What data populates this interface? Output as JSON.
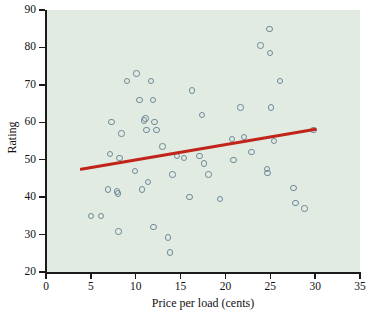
{
  "chart_data": {
    "type": "scatter",
    "title": "",
    "xlabel": "Price per load (cents)",
    "ylabel": "Rating",
    "xlim": [
      0,
      35
    ],
    "ylim": [
      20,
      90
    ],
    "xticks": [
      0,
      5,
      10,
      15,
      20,
      25,
      30,
      35
    ],
    "yticks": [
      20,
      30,
      40,
      50,
      60,
      70,
      80,
      90
    ],
    "grid": false,
    "legend": "none",
    "panel_color": "#e2ebe1",
    "marker_color": "#6e8a9c",
    "trendline_color": "#c0241b",
    "points": [
      {
        "x": 5.0,
        "y": 35.0
      },
      {
        "x": 6.1,
        "y": 35.0
      },
      {
        "x": 6.9,
        "y": 42.0
      },
      {
        "x": 7.1,
        "y": 51.5
      },
      {
        "x": 7.3,
        "y": 60.0
      },
      {
        "x": 7.9,
        "y": 41.5
      },
      {
        "x": 8.0,
        "y": 41.0
      },
      {
        "x": 8.1,
        "y": 30.8
      },
      {
        "x": 8.2,
        "y": 50.5
      },
      {
        "x": 8.4,
        "y": 57.0
      },
      {
        "x": 9.0,
        "y": 71.0
      },
      {
        "x": 9.9,
        "y": 47.0
      },
      {
        "x": 10.1,
        "y": 73.0
      },
      {
        "x": 10.4,
        "y": 66.0
      },
      {
        "x": 10.7,
        "y": 42.0
      },
      {
        "x": 10.9,
        "y": 60.5
      },
      {
        "x": 11.1,
        "y": 61.0
      },
      {
        "x": 11.2,
        "y": 58.0
      },
      {
        "x": 11.4,
        "y": 44.0
      },
      {
        "x": 11.7,
        "y": 71.0
      },
      {
        "x": 11.9,
        "y": 66.0
      },
      {
        "x": 12.0,
        "y": 32.0
      },
      {
        "x": 12.1,
        "y": 60.0
      },
      {
        "x": 12.3,
        "y": 58.0
      },
      {
        "x": 13.0,
        "y": 53.5
      },
      {
        "x": 13.6,
        "y": 29.2
      },
      {
        "x": 13.8,
        "y": 25.2
      },
      {
        "x": 14.1,
        "y": 46.0
      },
      {
        "x": 14.6,
        "y": 51.0
      },
      {
        "x": 15.4,
        "y": 50.5
      },
      {
        "x": 16.0,
        "y": 40.0
      },
      {
        "x": 16.3,
        "y": 68.5
      },
      {
        "x": 17.1,
        "y": 51.0
      },
      {
        "x": 17.4,
        "y": 62.0
      },
      {
        "x": 17.6,
        "y": 49.0
      },
      {
        "x": 18.1,
        "y": 46.0
      },
      {
        "x": 19.4,
        "y": 39.5
      },
      {
        "x": 20.7,
        "y": 55.5
      },
      {
        "x": 20.9,
        "y": 50.0
      },
      {
        "x": 21.7,
        "y": 64.0
      },
      {
        "x": 22.1,
        "y": 56.0
      },
      {
        "x": 22.9,
        "y": 52.0
      },
      {
        "x": 23.9,
        "y": 80.5
      },
      {
        "x": 24.6,
        "y": 47.5
      },
      {
        "x": 24.7,
        "y": 46.5
      },
      {
        "x": 24.9,
        "y": 85.0
      },
      {
        "x": 25.0,
        "y": 78.5
      },
      {
        "x": 25.1,
        "y": 64.0
      },
      {
        "x": 25.4,
        "y": 55.0
      },
      {
        "x": 26.1,
        "y": 71.0
      },
      {
        "x": 27.6,
        "y": 42.5
      },
      {
        "x": 27.8,
        "y": 38.5
      },
      {
        "x": 28.8,
        "y": 37.0
      },
      {
        "x": 29.8,
        "y": 58.0
      }
    ],
    "trendline": {
      "x1": 3.8,
      "y1": 47.5,
      "x2": 30.2,
      "y2": 58.3
    }
  }
}
